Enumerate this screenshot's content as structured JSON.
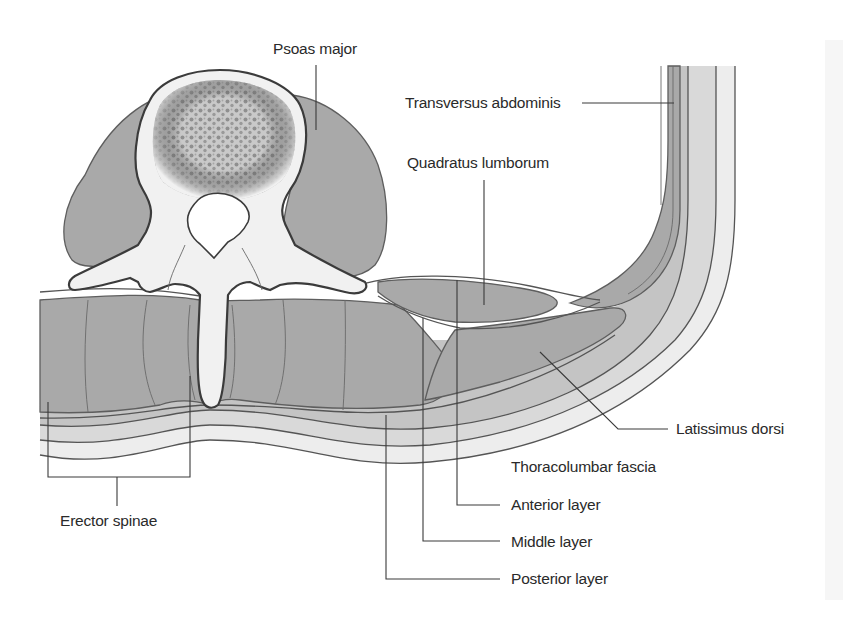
{
  "figure": {
    "colors": {
      "muscle": "#a9a9a9",
      "bone_cortex": "#f1f1f1",
      "bone_cancellous": "#8f8f8f",
      "fascia_deep": "#c4c4c4",
      "fascia_mid": "#d9d9d9",
      "fascia_superficial": "#ededed",
      "outline": "#555555",
      "text": "#2a2a2a"
    }
  },
  "labels": {
    "psoas_major": "Psoas major",
    "transversus_abdominis": "Transversus abdominis",
    "quadratus_lumborum": "Quadratus lumborum",
    "latissimus_dorsi": "Latissimus dorsi",
    "thoracolumbar_fascia": "Thoracolumbar fascia",
    "anterior_layer": "Anterior layer",
    "middle_layer": "Middle layer",
    "posterior_layer": "Posterior layer",
    "erector_spinae": "Erector spinae"
  },
  "structures": [
    {
      "id": "vertebral-body",
      "name": "Vertebral body"
    },
    {
      "id": "vertebral-foramen",
      "name": "Vertebral foramen"
    },
    {
      "id": "spinous-process",
      "name": "Spinous process"
    },
    {
      "id": "transverse-process-left",
      "name": "Transverse process"
    },
    {
      "id": "transverse-process-right",
      "name": "Transverse process"
    },
    {
      "id": "psoas-major",
      "name": "Psoas major"
    },
    {
      "id": "quadratus-lumborum",
      "name": "Quadratus lumborum"
    },
    {
      "id": "erector-spinae",
      "name": "Erector spinae"
    },
    {
      "id": "latissimus-dorsi",
      "name": "Latissimus dorsi"
    },
    {
      "id": "transversus-abdominis",
      "name": "Transversus abdominis"
    },
    {
      "id": "thoracolumbar-fascia",
      "name": "Thoracolumbar fascia"
    }
  ]
}
